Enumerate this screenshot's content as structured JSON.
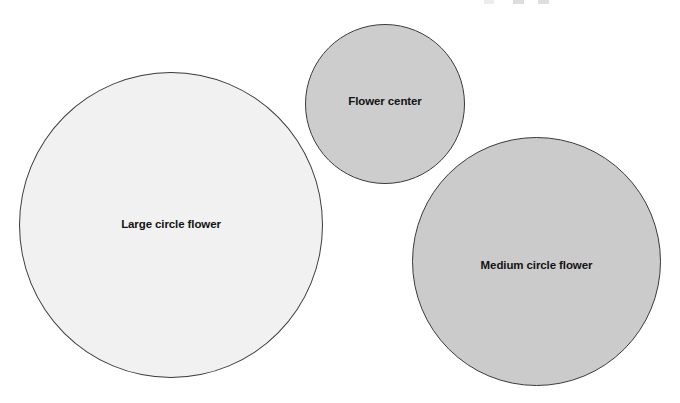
{
  "page": {
    "background_color": "#ffffff",
    "width": 680,
    "height": 403
  },
  "shapes": [
    {
      "id": "large-circle-flower",
      "label": "Large circle flower",
      "kind": "circle",
      "fill_color": "#f1f1f1",
      "stroke_color": "#3b3b3b",
      "center_x": 171,
      "center_y": 225,
      "diameter": 304
    },
    {
      "id": "flower-center",
      "label": "Flower center",
      "kind": "circle",
      "fill_color": "#cdcdcd",
      "stroke_color": "#3b3b3b",
      "center_x": 385,
      "center_y": 104,
      "diameter": 160
    },
    {
      "id": "medium-circle-flower",
      "label": "Medium circle flower",
      "kind": "circle",
      "fill_color": "#cbcbcb",
      "stroke_color": "#3b3b3b",
      "center_x": 536,
      "center_y": 261,
      "diameter": 249
    }
  ],
  "label_color": "#141414"
}
